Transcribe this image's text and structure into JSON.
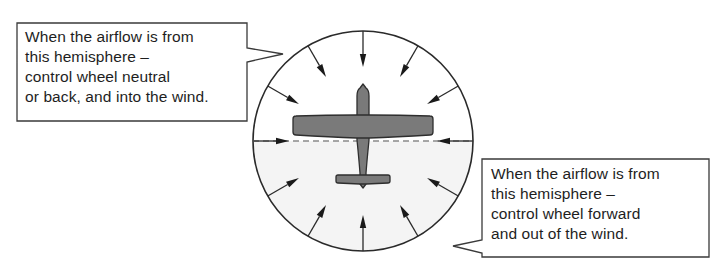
{
  "diagram": {
    "colors": {
      "line": "#2a2a2a",
      "airplane_fill": "#7a7a7a",
      "airplane_stroke": "#2e2e2e",
      "dashed_line": "#8a8a8a",
      "lower_hemisphere_fill": "#f4f4f4",
      "background": "#ffffff"
    },
    "circle": {
      "center_x": 363,
      "center_y": 141,
      "radius": 110
    },
    "arrows": {
      "count": 12,
      "spacing_degrees": 30,
      "direction": "inward",
      "icon": "arrow-inward-icon"
    },
    "airplane": {
      "icon": "airplane-top-view-icon"
    },
    "divider": {
      "style": "dashed",
      "label": "hemisphere-divider"
    }
  },
  "callouts": {
    "upper": {
      "lines": [
        "When the airflow is from",
        "this hemisphere –",
        "control wheel neutral",
        "or back, and into the wind."
      ]
    },
    "lower": {
      "lines": [
        "When the airflow is from",
        "this hemisphere –",
        "control wheel forward",
        "and out of the wind."
      ]
    }
  }
}
